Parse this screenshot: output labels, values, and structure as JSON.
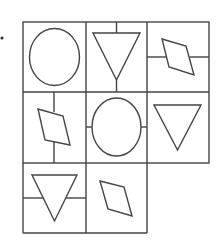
{
  "figure": {
    "stroke_color": "#444444",
    "background": "#ffffff",
    "marker": "•",
    "cells": [
      {
        "row": 1,
        "col": 1,
        "shape": "circle",
        "line": "none"
      },
      {
        "row": 1,
        "col": 2,
        "shape": "down-triangle",
        "line": "vertical"
      },
      {
        "row": 1,
        "col": 3,
        "shape": "parallelogram",
        "line": "horizontal"
      },
      {
        "row": 2,
        "col": 1,
        "shape": "parallelogram",
        "line": "vertical"
      },
      {
        "row": 2,
        "col": 2,
        "shape": "circle",
        "line": "horizontal"
      },
      {
        "row": 2,
        "col": 3,
        "shape": "down-triangle",
        "line": "none"
      },
      {
        "row": 3,
        "col": 1,
        "shape": "down-triangle",
        "line": "horizontal"
      },
      {
        "row": 3,
        "col": 2,
        "shape": "parallelogram",
        "line": "none"
      },
      {
        "row": 3,
        "col": 3,
        "shape": "empty",
        "line": "none"
      }
    ]
  }
}
